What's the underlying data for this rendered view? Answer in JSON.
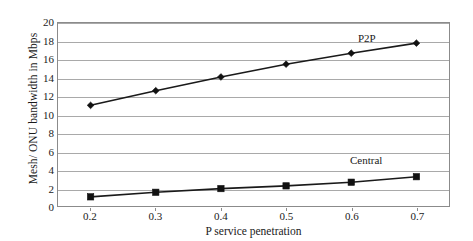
{
  "chart_data": {
    "type": "line",
    "title": "",
    "xlabel": "P service penetration",
    "ylabel": "Mesh/ ONU bandwidth in Mbps",
    "x": [
      0.2,
      0.3,
      0.4,
      0.5,
      0.6,
      0.7
    ],
    "xticklabels": [
      "0.2",
      "0.3",
      "0.4",
      "0.5",
      "0.6",
      "0.7"
    ],
    "yticklabels": [
      "0",
      "2",
      "4",
      "6",
      "8",
      "10",
      "12",
      "14",
      "16",
      "18",
      "20"
    ],
    "yticks": [
      0,
      2,
      4,
      6,
      8,
      10,
      12,
      14,
      16,
      18,
      20
    ],
    "xlim": [
      0.15,
      0.75
    ],
    "ylim": [
      0,
      20
    ],
    "grid": "horizontal",
    "legend_position": "inline-right",
    "series": [
      {
        "name": "P2P",
        "marker": "diamond",
        "color": "#111111",
        "values": [
          11.0,
          12.6,
          14.1,
          15.5,
          16.7,
          17.8
        ]
      },
      {
        "name": "Central",
        "marker": "square",
        "color": "#111111",
        "values": [
          1.0,
          1.5,
          1.9,
          2.2,
          2.6,
          3.2
        ]
      }
    ],
    "annotations": [
      {
        "text": "P2P",
        "series": "P2P"
      },
      {
        "text": "Central",
        "series": "Central"
      }
    ]
  }
}
